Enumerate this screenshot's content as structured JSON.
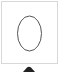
{
  "palette": {
    "tools": [
      {
        "name": "ellipse",
        "icon": "ellipse-icon",
        "label": "Ellipse",
        "stroke_color": "#555555",
        "border_color": "#d8d8d8"
      },
      {
        "name": "partial-next-tool",
        "icon": "partial-icon",
        "label": "",
        "fill_color": "#222222"
      }
    ]
  }
}
